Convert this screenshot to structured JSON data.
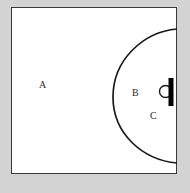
{
  "figure": {
    "background_color": "#d3d3d3",
    "panel_color": "#ffffff",
    "border_color": "#3a3a3a",
    "stroke_color": "#1a1a1a",
    "labels": {
      "region_a": "A",
      "region_b": "B",
      "region_c": "C"
    },
    "elements": {
      "frame_name": "outer-rectangle-boundary",
      "arc_name": "large-curved-boundary-arc",
      "bar_name": "black-vertical-bar",
      "circle_name": "small-circle-marker"
    }
  }
}
